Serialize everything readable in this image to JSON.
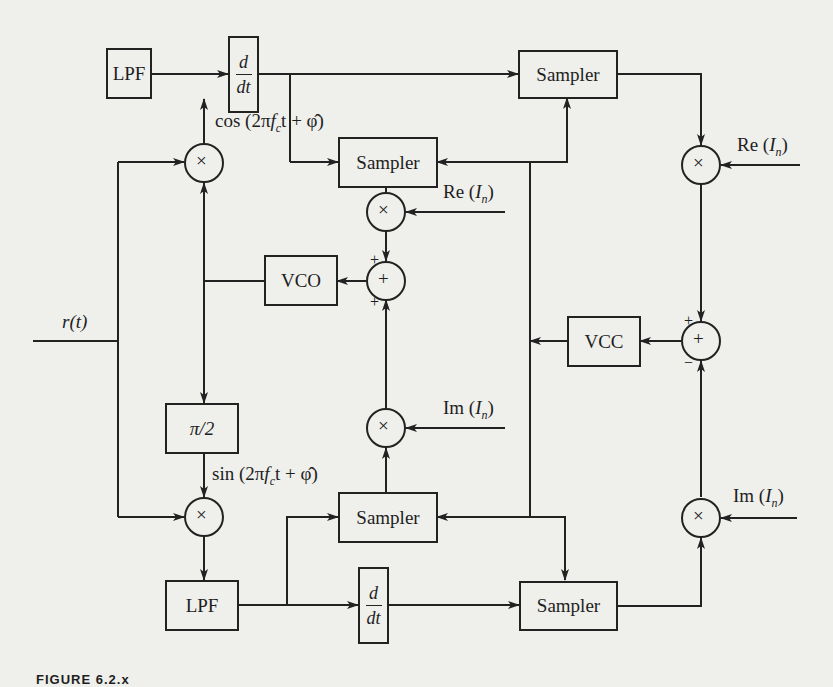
{
  "diagram": {
    "type": "block-diagram",
    "input": {
      "label": "r(t)"
    },
    "blocks": {
      "lpf_top": {
        "label": "LPF"
      },
      "ddt_top": {
        "num": "d",
        "den": "dt"
      },
      "sampler_top_right": {
        "label": "Sampler"
      },
      "sampler_mid_top": {
        "label": "Sampler"
      },
      "vco": {
        "label": "VCO"
      },
      "phase_shift": {
        "label": "π/2"
      },
      "sampler_mid_bottom": {
        "label": "Sampler"
      },
      "lpf_bottom": {
        "label": "LPF"
      },
      "ddt_bottom": {
        "num": "d",
        "den": "dt"
      },
      "sampler_bottom_right": {
        "label": "Sampler"
      },
      "vcc": {
        "label": "VCC"
      }
    },
    "signals": {
      "cos_ref": {
        "pre": "cos (2π",
        "f": "f",
        "sub": "c",
        "post": "t + φ̂)"
      },
      "sin_ref": {
        "pre": "sin (2π",
        "f": "f",
        "sub": "c",
        "post": "t + φ̂)"
      },
      "re_in_1": {
        "pre": "Re (",
        "I": "I",
        "sub": "n",
        "post": ")"
      },
      "re_in_2": {
        "pre": "Re (",
        "I": "I",
        "sub": "n",
        "post": ")"
      },
      "im_in_1": {
        "pre": "Im (",
        "I": "I",
        "sub": "n",
        "post": ")"
      },
      "im_in_2": {
        "pre": "Im (",
        "I": "I",
        "sub": "n",
        "post": ")"
      }
    },
    "operators": {
      "multiply": "×",
      "sum": "+",
      "sign_plus": "+",
      "sign_minus": "−"
    },
    "caption": "FIGURE 6.2.x"
  }
}
